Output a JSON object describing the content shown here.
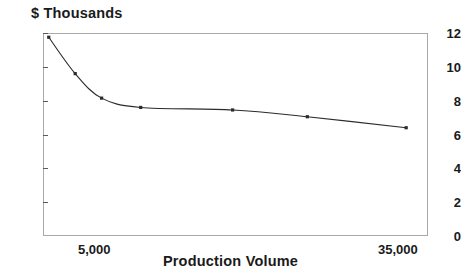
{
  "chart_data": {
    "type": "line",
    "title": "$ Thousands",
    "xlabel": "Production Volume",
    "ylabel": "$ Thousands",
    "grid": false,
    "legend": "none",
    "markers": "small filled squares",
    "xlim": [
      3000,
      36500
    ],
    "ylim": [
      0,
      12
    ],
    "x_tick_labels": [
      "5,000",
      "35,000"
    ],
    "x_tick_values": [
      5000,
      35000
    ],
    "y_tick_labels": [
      "0",
      "2",
      "4",
      "6",
      "8",
      "10",
      "12"
    ],
    "y_tick_values": [
      0,
      2,
      4,
      6,
      8,
      10,
      12
    ],
    "series": [
      {
        "name": "Unit cost",
        "x": [
          3500,
          5800,
          8100,
          11500,
          19500,
          26000,
          34600
        ],
        "values": [
          11.75,
          9.6,
          8.15,
          7.6,
          7.45,
          7.05,
          6.4
        ]
      }
    ],
    "points": [
      {
        "x": 3500,
        "y": 11.75
      },
      {
        "x": 5800,
        "y": 9.6
      },
      {
        "x": 8100,
        "y": 8.15
      },
      {
        "x": 11500,
        "y": 7.6
      },
      {
        "x": 19500,
        "y": 7.45
      },
      {
        "x": 26000,
        "y": 7.05
      },
      {
        "x": 34600,
        "y": 6.4
      }
    ],
    "colors": {
      "curve": "#2b2b2b",
      "frame": "#a9a9a9",
      "text": "#1a1a1a",
      "background": "#ffffff"
    }
  },
  "axes": {
    "y_labels": [
      "12",
      "10",
      "8",
      "6",
      "4",
      "2",
      "0"
    ],
    "x_labels": [
      {
        "text": "5,000"
      },
      {
        "text": "35,000"
      }
    ]
  }
}
